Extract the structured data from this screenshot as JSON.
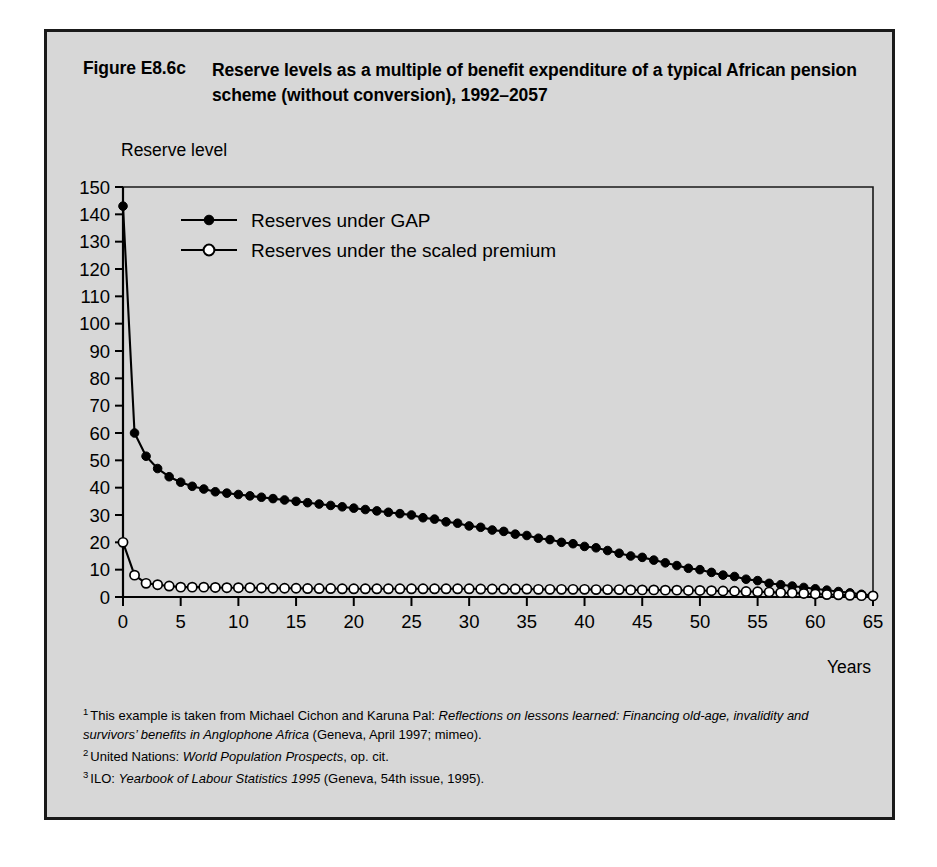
{
  "figure": {
    "number": "Figure E8.6c",
    "title": "Reserve levels as a multiple of benefit expenditure of a typical African pension scheme (without conversion), 1992–2057"
  },
  "footnotes": [
    {
      "marker": "1",
      "parts": [
        {
          "text": "This example is taken from Michael Cichon and Karuna Pal: ",
          "italic": false
        },
        {
          "text": "Reflections on lessons learned: Financing old-age, invalidity and survivors’ benefits in Anglophone Africa",
          "italic": true
        },
        {
          "text": " (Geneva, April 1997; mimeo).",
          "italic": false
        }
      ]
    },
    {
      "marker": "2",
      "parts": [
        {
          "text": "United Nations: ",
          "italic": false
        },
        {
          "text": "World Population Prospects",
          "italic": true
        },
        {
          "text": ", op. cit.",
          "italic": false
        }
      ]
    },
    {
      "marker": "3",
      "parts": [
        {
          "text": "ILO: ",
          "italic": false
        },
        {
          "text": "Yearbook of Labour Statistics 1995",
          "italic": true
        },
        {
          "text": " (Geneva, 54th issue, 1995).",
          "italic": false
        }
      ]
    }
  ],
  "colors": {
    "background": "#d7d7d7",
    "frame": "#1a1a1a",
    "axis": "#000000",
    "series_gap": "#000000",
    "series_scaled_fill": "#ffffff",
    "series_scaled_stroke": "#000000"
  },
  "chart_data": {
    "type": "line",
    "title": "Reserve levels as a multiple of benefit expenditure of a typical African pension scheme (without conversion), 1992–2057",
    "xlabel": "Years",
    "ylabel": "Reserve level",
    "xlim": [
      0,
      65
    ],
    "ylim": [
      0,
      150
    ],
    "xticks": [
      0,
      5,
      10,
      15,
      20,
      25,
      30,
      35,
      40,
      45,
      50,
      55,
      60,
      65
    ],
    "yticks": [
      0,
      10,
      20,
      30,
      40,
      50,
      60,
      70,
      80,
      90,
      100,
      110,
      120,
      130,
      140,
      150
    ],
    "grid": false,
    "legend_position": "upper-left-inside",
    "x": [
      0,
      1,
      2,
      3,
      4,
      5,
      6,
      7,
      8,
      9,
      10,
      11,
      12,
      13,
      14,
      15,
      16,
      17,
      18,
      19,
      20,
      21,
      22,
      23,
      24,
      25,
      26,
      27,
      28,
      29,
      30,
      31,
      32,
      33,
      34,
      35,
      36,
      37,
      38,
      39,
      40,
      41,
      42,
      43,
      44,
      45,
      46,
      47,
      48,
      49,
      50,
      51,
      52,
      53,
      54,
      55,
      56,
      57,
      58,
      59,
      60,
      61,
      62,
      63,
      64,
      65
    ],
    "series": [
      {
        "name": "Reserves under GAP",
        "marker": "filled-circle",
        "values": [
          143,
          60,
          51.5,
          47,
          44,
          42,
          40.5,
          39.5,
          38.5,
          38,
          37.5,
          37,
          36.5,
          36,
          35.5,
          35,
          34.5,
          34,
          33.5,
          33,
          32.5,
          32,
          31.5,
          31,
          30.5,
          30,
          29,
          28.5,
          27.5,
          27,
          26,
          25.5,
          24.5,
          24,
          23,
          22.5,
          21.5,
          21,
          20,
          19.5,
          18.5,
          18,
          17,
          16,
          15,
          14.5,
          13.5,
          12.5,
          11.5,
          10.5,
          10,
          9,
          8,
          7.5,
          6.5,
          6,
          5,
          4.5,
          4,
          3.5,
          3,
          2.5,
          2,
          1.5,
          1,
          0.5
        ]
      },
      {
        "name": "Reserves under the scaled premium",
        "marker": "open-circle",
        "values": [
          20,
          8,
          5,
          4.5,
          4,
          3.6,
          3.6,
          3.6,
          3.5,
          3.4,
          3.4,
          3.4,
          3.3,
          3.2,
          3.2,
          3.2,
          3.1,
          3.1,
          3.1,
          3,
          3,
          3,
          3,
          3,
          3,
          3,
          3,
          3,
          3,
          3,
          3,
          2.9,
          2.9,
          2.9,
          2.9,
          2.9,
          2.8,
          2.8,
          2.8,
          2.8,
          2.8,
          2.7,
          2.7,
          2.7,
          2.6,
          2.6,
          2.6,
          2.5,
          2.5,
          2.4,
          2.4,
          2.3,
          2.2,
          2.1,
          2,
          1.9,
          1.8,
          1.6,
          1.5,
          1.3,
          1.1,
          0.9,
          0.8,
          0.6,
          0.5,
          0.4
        ]
      }
    ],
    "legend": [
      "Reserves under GAP",
      "Reserves under the scaled premium"
    ]
  }
}
